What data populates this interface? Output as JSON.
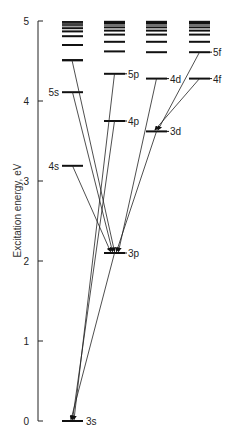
{
  "diagram": {
    "type": "energy-level diagram",
    "axis": {
      "label": "Excitation energy, eV",
      "ticks": [
        "0",
        "1",
        "2",
        "3",
        "4",
        "5"
      ],
      "min": 0,
      "max": 5
    },
    "columns": [
      {
        "id": "s",
        "levels": [
          {
            "label": "3s",
            "energy": 0.0
          },
          {
            "label": "4s",
            "energy": 3.19
          },
          {
            "label": "5s",
            "energy": 4.11
          },
          {
            "label": "",
            "energy": 4.51
          }
        ]
      },
      {
        "id": "p",
        "levels": [
          {
            "label": "3p",
            "energy": 2.1
          },
          {
            "label": "4p",
            "energy": 3.75
          },
          {
            "label": "5p",
            "energy": 4.34
          }
        ]
      },
      {
        "id": "d",
        "levels": [
          {
            "label": "3d",
            "energy": 3.62
          },
          {
            "label": "4d",
            "energy": 4.28
          }
        ]
      },
      {
        "id": "f",
        "levels": [
          {
            "label": "4f",
            "energy": 4.28
          },
          {
            "label": "5f",
            "energy": 4.61
          }
        ]
      }
    ],
    "transitions": [
      {
        "from": "4s",
        "to": "3p"
      },
      {
        "from": "5s",
        "to": "3p"
      },
      {
        "from": "6s",
        "to": "3p"
      },
      {
        "from": "3d",
        "to": "3p"
      },
      {
        "from": "4d",
        "to": "3p"
      },
      {
        "from": "4f",
        "to": "3d"
      },
      {
        "from": "5f",
        "to": "3d"
      },
      {
        "from": "3p",
        "to": "3s"
      },
      {
        "from": "4p",
        "to": "3s"
      },
      {
        "from": "5p",
        "to": "3s"
      }
    ]
  }
}
